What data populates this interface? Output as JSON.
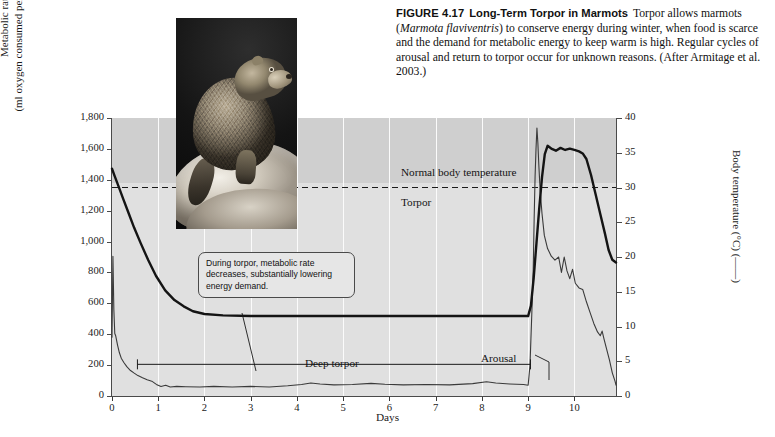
{
  "caption": {
    "figure_label": "FIGURE 4.17",
    "figure_title": "Long-Term Torpor in Marmots",
    "body_part1": "Torpor allows marmots (",
    "species_italic": "Marmota flaviventris",
    "body_part2": ") to conserve energy during winter, when food is scarce and the demand for metabolic energy to keep warm is high. Regular cycles of arousal and return to torpor occur for unknown reasons. (After Armitage et al. 2003.)"
  },
  "photo": {
    "alt": "marmot-photograph",
    "subject": "marmot sitting on rock"
  },
  "annotations": {
    "normal_body_temperature": "Normal body temperature",
    "torpor": "Torpor",
    "deep_torpor": "Deep torpor",
    "arousal": "Arousal",
    "callout": "During torpor, metabolic rate decreases, substantially lowering energy demand."
  },
  "chart_data": {
    "type": "line",
    "title": "Long-Term Torpor in Marmots",
    "xlabel": "Days",
    "xlim": [
      0,
      10.9
    ],
    "xticks": [
      0,
      1,
      2,
      3,
      4,
      5,
      6,
      7,
      8,
      9,
      10
    ],
    "xticklabels": [
      "0",
      "1",
      "2",
      "3",
      "4",
      "5",
      "6",
      "7",
      "8",
      "9",
      "10"
    ],
    "grid": "vertical-white",
    "axes": [
      {
        "side": "left",
        "ylabel_line1": "Metabolic rate",
        "ylabel_line2": "(ml oxygen consumed per hour) (——)",
        "ylim": [
          0,
          1800
        ],
        "yticks": [
          0,
          200,
          400,
          600,
          800,
          1000,
          1200,
          1400,
          1600,
          1800
        ],
        "yticklabels": [
          "0",
          "200",
          "400",
          "600",
          "800",
          "1,000",
          "1,200",
          "1,400",
          "1,600",
          "1,800"
        ]
      },
      {
        "side": "right",
        "ylabel": "Body temperature (°C) (——)",
        "ylim": [
          0,
          40
        ],
        "yticks": [
          0,
          5,
          10,
          15,
          20,
          25,
          30,
          35,
          40
        ],
        "yticklabels": [
          "0",
          "5",
          "10",
          "15",
          "20",
          "25",
          "30",
          "35",
          "40"
        ]
      }
    ],
    "reference_line": {
      "label": "Normal body temperature",
      "value_celsius": 30,
      "style": "dashed"
    },
    "span_bar": {
      "label": "Deep torpor",
      "x_start": 0.55,
      "x_end": 9.05
    },
    "series": [
      {
        "name": "Body temperature",
        "axis": "right",
        "units": "°C",
        "style": "thick-solid",
        "points": [
          [
            0.0,
            32.7
          ],
          [
            0.06,
            31.6
          ],
          [
            0.14,
            30.2
          ],
          [
            0.24,
            28.4
          ],
          [
            0.36,
            26.3
          ],
          [
            0.48,
            24.2
          ],
          [
            0.62,
            22.0
          ],
          [
            0.78,
            19.6
          ],
          [
            0.95,
            17.3
          ],
          [
            1.15,
            15.2
          ],
          [
            1.35,
            13.8
          ],
          [
            1.55,
            12.9
          ],
          [
            1.75,
            12.2
          ],
          [
            2.0,
            11.8
          ],
          [
            2.4,
            11.6
          ],
          [
            3.0,
            11.5
          ],
          [
            4.0,
            11.5
          ],
          [
            5.0,
            11.5
          ],
          [
            6.0,
            11.5
          ],
          [
            7.0,
            11.5
          ],
          [
            8.0,
            11.5
          ],
          [
            8.8,
            11.5
          ],
          [
            9.0,
            11.5
          ],
          [
            9.06,
            13.0
          ],
          [
            9.12,
            17.0
          ],
          [
            9.18,
            22.0
          ],
          [
            9.24,
            27.0
          ],
          [
            9.3,
            31.5
          ],
          [
            9.36,
            34.8
          ],
          [
            9.42,
            36.0
          ],
          [
            9.5,
            35.6
          ],
          [
            9.6,
            35.3
          ],
          [
            9.7,
            35.7
          ],
          [
            9.8,
            35.4
          ],
          [
            9.9,
            35.6
          ],
          [
            10.0,
            35.4
          ],
          [
            10.1,
            35.2
          ],
          [
            10.18,
            34.9
          ],
          [
            10.26,
            34.1
          ],
          [
            10.36,
            31.8
          ],
          [
            10.46,
            29.0
          ],
          [
            10.56,
            26.2
          ],
          [
            10.66,
            23.4
          ],
          [
            10.74,
            21.0
          ],
          [
            10.82,
            19.6
          ],
          [
            10.9,
            19.2
          ]
        ]
      },
      {
        "name": "Metabolic rate",
        "axis": "left",
        "units": "ml O2/hour",
        "style": "thin-solid",
        "points": [
          [
            0.0,
            380
          ],
          [
            0.02,
            905
          ],
          [
            0.04,
            560
          ],
          [
            0.06,
            405
          ],
          [
            0.08,
            390
          ],
          [
            0.12,
            330
          ],
          [
            0.16,
            280
          ],
          [
            0.2,
            245
          ],
          [
            0.26,
            215
          ],
          [
            0.32,
            190
          ],
          [
            0.4,
            165
          ],
          [
            0.48,
            148
          ],
          [
            0.56,
            132
          ],
          [
            0.66,
            118
          ],
          [
            0.76,
            105
          ],
          [
            0.86,
            96
          ],
          [
            0.96,
            75
          ],
          [
            1.06,
            62
          ],
          [
            1.16,
            70
          ],
          [
            1.26,
            58
          ],
          [
            1.4,
            62
          ],
          [
            1.6,
            60
          ],
          [
            1.9,
            58
          ],
          [
            2.2,
            62
          ],
          [
            2.6,
            58
          ],
          [
            3.0,
            62
          ],
          [
            3.4,
            58
          ],
          [
            3.8,
            66
          ],
          [
            4.1,
            74
          ],
          [
            4.3,
            84
          ],
          [
            4.5,
            78
          ],
          [
            4.8,
            72
          ],
          [
            5.2,
            74
          ],
          [
            5.6,
            82
          ],
          [
            5.9,
            76
          ],
          [
            6.3,
            72
          ],
          [
            6.8,
            74
          ],
          [
            7.3,
            72
          ],
          [
            7.8,
            80
          ],
          [
            8.1,
            92
          ],
          [
            8.3,
            84
          ],
          [
            8.6,
            78
          ],
          [
            8.9,
            74
          ],
          [
            9.0,
            70
          ],
          [
            9.04,
            200
          ],
          [
            9.08,
            540
          ],
          [
            9.11,
            820
          ],
          [
            9.13,
            1150
          ],
          [
            9.15,
            1420
          ],
          [
            9.17,
            1600
          ],
          [
            9.19,
            1735
          ],
          [
            9.21,
            1640
          ],
          [
            9.23,
            1500
          ],
          [
            9.26,
            1330
          ],
          [
            9.3,
            1180
          ],
          [
            9.35,
            1040
          ],
          [
            9.42,
            955
          ],
          [
            9.5,
            905
          ],
          [
            9.58,
            880
          ],
          [
            9.66,
            900
          ],
          [
            9.72,
            800
          ],
          [
            9.78,
            900
          ],
          [
            9.84,
            810
          ],
          [
            9.9,
            760
          ],
          [
            9.96,
            820
          ],
          [
            10.02,
            730
          ],
          [
            10.1,
            700
          ],
          [
            10.18,
            690
          ],
          [
            10.26,
            610
          ],
          [
            10.34,
            540
          ],
          [
            10.42,
            470
          ],
          [
            10.5,
            415
          ],
          [
            10.56,
            390
          ],
          [
            10.6,
            420
          ],
          [
            10.64,
            370
          ],
          [
            10.7,
            300
          ],
          [
            10.76,
            230
          ],
          [
            10.82,
            150
          ],
          [
            10.88,
            95
          ],
          [
            10.9,
            70
          ]
        ]
      }
    ]
  }
}
